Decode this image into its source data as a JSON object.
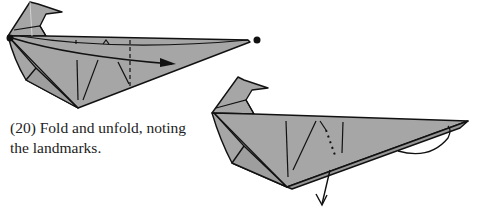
{
  "step": {
    "number": "(20)",
    "caption_line1": "(20) Fold and unfold, noting",
    "caption_line2": "the landmarks."
  },
  "figures": [
    {
      "id": "before",
      "description": "Origami bird-like model with a long tail, valley fold arrow from head point to tail tip, landmark creases marked",
      "paper_color": "#a6a6a6",
      "line_color": "#111111",
      "markers": [
        "fold-point-dot-left",
        "fold-point-dot-right"
      ],
      "arrows": [
        "valley-fold-arrow-right"
      ]
    },
    {
      "id": "after",
      "description": "Result after folding and unfolding, showing crease lines and an unfold arrow pointing downward",
      "paper_color": "#a6a6a6",
      "line_color": "#111111",
      "arrows": [
        "unfold-arrow-down",
        "rotation-curve-arrow"
      ]
    }
  ],
  "colors": {
    "paper": "#a6a6a6",
    "paper_dark": "#969696",
    "line": "#111111",
    "background": "#ffffff"
  }
}
